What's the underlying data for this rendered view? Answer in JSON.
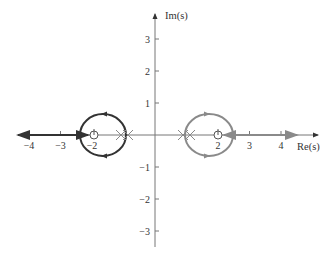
{
  "chart_data": {
    "type": "line",
    "title": "",
    "xlabel": "Re(s)",
    "ylabel": "Im(s)",
    "xlim": [
      -4.9,
      5.1
    ],
    "ylim": [
      -3.5,
      3.8
    ],
    "grid": false,
    "x_ticks": [
      -4,
      -3,
      -2,
      2,
      3,
      4
    ],
    "x_tick_labels": [
      "−4",
      "−3",
      "−2",
      "2",
      "3",
      "4"
    ],
    "y_ticks": [
      3,
      2,
      1,
      -1,
      -2,
      -3
    ],
    "y_tick_labels": [
      "3",
      "2",
      "1",
      "−1",
      "−2",
      "−3"
    ],
    "poles": [
      {
        "re": -1.15,
        "im": 0
      },
      {
        "re": -0.85,
        "im": 0
      },
      {
        "re": 0.85,
        "im": 0
      },
      {
        "re": 1.15,
        "im": 0
      }
    ],
    "zeros": [
      {
        "re": -2,
        "im": 0
      },
      {
        "re": 2,
        "im": 0
      }
    ],
    "series": [
      {
        "name": "left locus",
        "color": "#333333",
        "circle": {
          "center_re": -1.65,
          "center_im": 0,
          "radius_re": 0.73,
          "radius_im": 0.65
        },
        "real_axis_segment": [
          -4.7,
          -2.35
        ],
        "direction": "toward -infinity"
      },
      {
        "name": "right locus",
        "color": "#8a8a8a",
        "circle": {
          "center_re": 1.65,
          "center_im": 0,
          "radius_re": 0.74,
          "radius_im": 0.65
        },
        "real_axis_segment": [
          2.0,
          4.5
        ],
        "direction": "toward +4.5"
      }
    ]
  },
  "axes": {
    "x_label": "Re(s)",
    "y_label": "Im(s)",
    "axis_color": "#777777"
  }
}
